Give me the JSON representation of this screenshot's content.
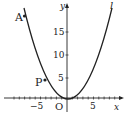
{
  "diagram": {
    "curve_label": "l",
    "x_axis_label": "x",
    "y_axis_label": "y",
    "origin_label": "O",
    "x_ticks": [
      {
        "value": -5,
        "label": "−5"
      },
      {
        "value": 5,
        "label": "5"
      }
    ],
    "y_ticks": [
      {
        "value": 5,
        "label": "5"
      },
      {
        "value": 10,
        "label": "10"
      },
      {
        "value": 15,
        "label": "15"
      }
    ],
    "points": [
      {
        "name": "A",
        "x": -8,
        "y": 18
      },
      {
        "name": "P",
        "x": -3,
        "y": 3.9
      }
    ],
    "curve": "parabola opening upward with vertex near origin"
  }
}
